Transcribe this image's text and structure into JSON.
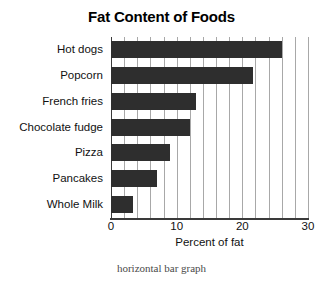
{
  "chart_data": {
    "type": "bar",
    "orientation": "horizontal",
    "title": "Fat Content of Foods",
    "xlabel": "Percent of fat",
    "ylabel": "",
    "caption": "horizontal bar graph",
    "categories": [
      "Hot dogs",
      "Popcorn",
      "French fries",
      "Chocolate fudge",
      "Pizza",
      "Pancakes",
      "Whole Milk"
    ],
    "values": [
      26,
      21.7,
      13,
      12,
      9,
      7,
      3.3
    ],
    "xlim": [
      0,
      30
    ],
    "xticks": [
      0,
      10,
      20,
      30
    ],
    "xtick_labels": [
      "0",
      "10",
      "20",
      "30"
    ],
    "gridlines_x": [
      0,
      2,
      4,
      6,
      8,
      10,
      12,
      14,
      16,
      18,
      20,
      22,
      24,
      26,
      28,
      30
    ],
    "grid": true,
    "legend": null,
    "bar_color": "#2e2e2e",
    "grid_color": "#a8a8a8",
    "axis_color": "#3a3a3a",
    "background": "#ffffff"
  }
}
